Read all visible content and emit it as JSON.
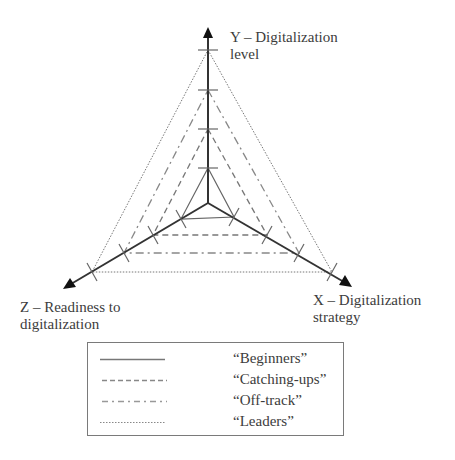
{
  "diagram": {
    "type": "radar",
    "axes": [
      {
        "id": "Y",
        "label_line1": "Y – Digitalization",
        "label_line2": "level"
      },
      {
        "id": "X",
        "label_line1": "X – Digitalization",
        "label_line2": "strategy"
      },
      {
        "id": "Z",
        "label_line1": "Z – Readiness to",
        "label_line2": "digitalization"
      }
    ],
    "ticks_per_axis": 4,
    "series": [
      {
        "name": "“Beginners”",
        "style": "solid",
        "level": 1
      },
      {
        "name": "“Catching-ups”",
        "style": "dashed",
        "level": 2
      },
      {
        "name": "“Off-track”",
        "style": "dash-dot",
        "level": 3
      },
      {
        "name": "“Leaders”",
        "style": "dotted",
        "level": 4
      }
    ]
  },
  "legend": {
    "items": [
      {
        "label": "“Beginners”"
      },
      {
        "label": "“Catching-ups”"
      },
      {
        "label": "“Off-track”"
      },
      {
        "label": "“Leaders”"
      }
    ]
  }
}
